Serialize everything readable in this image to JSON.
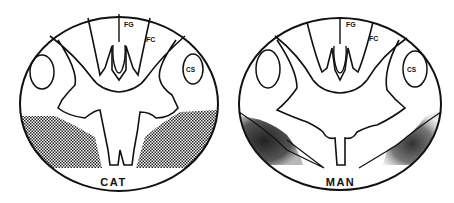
{
  "figure": {
    "panels": [
      {
        "caption": "CAT",
        "labels": {
          "fg": "FG",
          "fc": "FC",
          "cs": "CS"
        },
        "shading": "stippled ventral-lateral region (bilateral)"
      },
      {
        "caption": "MAN",
        "labels": {
          "fg": "FG",
          "fc": "FC",
          "cs": "CS"
        },
        "shading": "dark smudged ventral-lateral region (bilateral)"
      }
    ],
    "colors": {
      "ink": "#111111",
      "background": "#ffffff",
      "stipple": "#333333"
    }
  }
}
